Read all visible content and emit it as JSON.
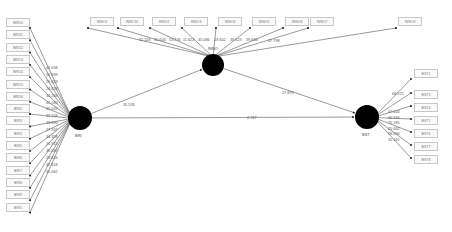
{
  "constructs": [
    {
      "id": "BRI",
      "label": "BRI",
      "cx": 80,
      "cy": 118,
      "r": 12
    },
    {
      "id": "INNO",
      "label": "INNO",
      "cx": 213,
      "cy": 65,
      "r": 11
    },
    {
      "id": "BST",
      "label": "BST",
      "cx": 367,
      "cy": 117,
      "r": 12
    }
  ],
  "indicators": {
    "BRI": [
      {
        "label": "BRI10",
        "t": "42.058"
      },
      {
        "label": "BRI11",
        "t": "56.999"
      },
      {
        "label": "BRI12",
        "t": "29.423"
      },
      {
        "label": "BRI13",
        "t": "24.633"
      },
      {
        "label": "BRI14",
        "t": "34.269"
      },
      {
        "label": "BRI15",
        "t": "41.580"
      },
      {
        "label": "BRI16",
        "t": "35.047"
      },
      {
        "label": "BRI2",
        "t": "32.159"
      },
      {
        "label": "BRI3",
        "t": "33.690"
      },
      {
        "label": "BRI4",
        "t": "27.167"
      },
      {
        "label": "BRI5",
        "t": "34.358"
      },
      {
        "label": "BRI6",
        "t": "31.915"
      },
      {
        "label": "BRI7",
        "t": "35.587"
      },
      {
        "label": "BRI8",
        "t": "23.624"
      },
      {
        "label": "BRI9",
        "t": "42.618"
      },
      {
        "label": "BRI1",
        "t": "35.062"
      }
    ],
    "INNO": [
      {
        "label": "INNO1",
        "t": "52.118"
      },
      {
        "label": "INNO10",
        "t": "50.634"
      },
      {
        "label": "INNO2",
        "t": "53.176"
      },
      {
        "label": "INNO3",
        "t": "11.624"
      },
      {
        "label": "INNO4",
        "t": "45.086"
      },
      {
        "label": "INNO5",
        "t": "23.602"
      },
      {
        "label": "INNO6",
        "t": "39.623"
      },
      {
        "label": "INNO7",
        "t": "39.656"
      },
      {
        "label": "INNO8",
        "t": "47.798"
      }
    ],
    "BST": [
      {
        "label": "BST1",
        "t": "64.972"
      },
      {
        "label": "BST3",
        "t": "47.044"
      },
      {
        "label": "BST4",
        "t": "40.334"
      },
      {
        "label": "BST5",
        "t": "71.285"
      },
      {
        "label": "BST6",
        "t": "25.662"
      },
      {
        "label": "BST7",
        "t": "58.990"
      },
      {
        "label": "BST8",
        "t": "31.162"
      }
    ]
  },
  "paths": [
    {
      "from": "BRI",
      "to": "INNO",
      "t": "16.533"
    },
    {
      "from": "INNO",
      "to": "BST",
      "t": "17.870"
    },
    {
      "from": "BRI",
      "to": "BST",
      "t": "2.747"
    }
  ],
  "colors": {
    "construct_fill": "#000000",
    "line": "#555555",
    "box_border": "#c8c8c8",
    "text": "#555555"
  }
}
